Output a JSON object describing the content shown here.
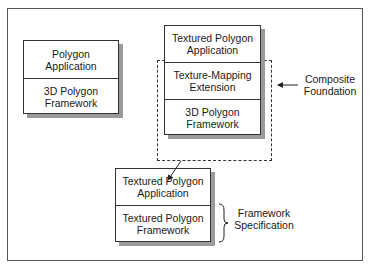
{
  "diagram": {
    "left_stack": {
      "layers": [
        "Polygon\nApplication",
        "3D Polygon\nFramework"
      ]
    },
    "top_stack": {
      "layers": [
        "Textured Polygon\nApplication",
        "Texture-Mapping\nExtension",
        "3D Polygon\nFramework"
      ]
    },
    "bottom_stack": {
      "layers": [
        "Textured Polygon\nApplication",
        "Textured Polygon\nFramework"
      ]
    },
    "annotations": {
      "composite_foundation": "Composite\nFoundation",
      "framework_specification": "Framework\nSpecification"
    }
  }
}
